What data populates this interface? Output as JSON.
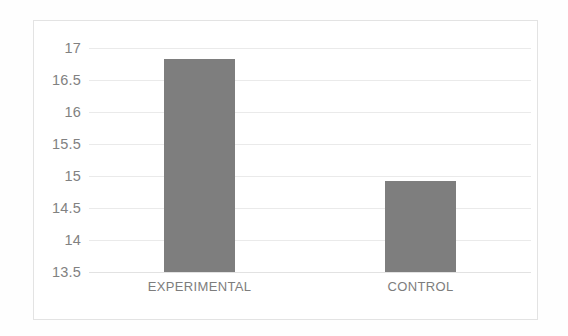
{
  "chart_data": {
    "type": "bar",
    "title": "",
    "subtitle": "",
    "xlabel": "",
    "ylabel": "",
    "categories": [
      "EXPERIMENTAL",
      "CONTROL"
    ],
    "values": [
      16.83,
      14.92
    ],
    "series": [
      {
        "name": "",
        "values": [
          16.83,
          14.92
        ]
      }
    ],
    "ylim": [
      13.5,
      17
    ],
    "ytick_labels": [
      "17",
      "16.5",
      "16",
      "15.5",
      "15",
      "14.5",
      "14",
      "13.5"
    ],
    "ytick_values": [
      17,
      16.5,
      16,
      15.5,
      15,
      14.5,
      14,
      13.5
    ],
    "grid": true,
    "legend": false,
    "legend_position": "none",
    "bar_color": "#7e7e7e",
    "gridline_color": "#eaeaea",
    "axis_text_color": "#818181",
    "frame_color": "#e3e3e3",
    "background_color": "#ffffff"
  }
}
